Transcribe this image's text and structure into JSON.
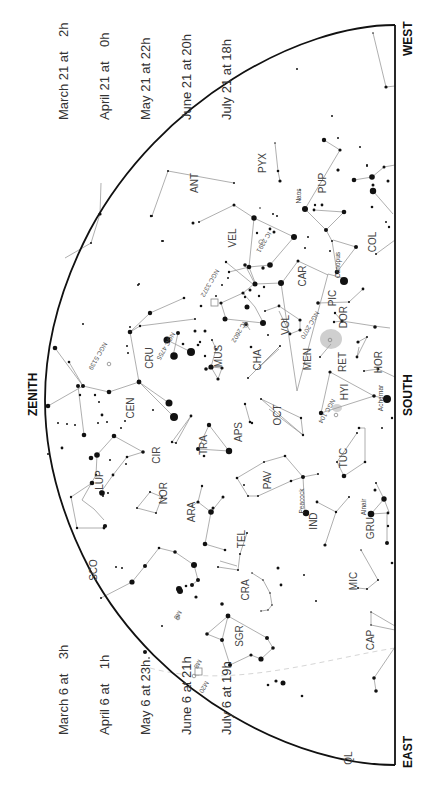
{
  "chart_title": "",
  "directions": {
    "west": "WEST",
    "east": "EAST",
    "south": "SOUTH",
    "zenith": "ZENITH"
  },
  "date_blocks": {
    "top": [
      "March 21 at    2h",
      "April 21 at    0h",
      "May 21 at 22h",
      "June 21 at 20h",
      "July 21 at 18h"
    ],
    "bottom": [
      "March 6 at    3h",
      "April 6 at    1h",
      "May 6 at 23h",
      "June 6 at 21h",
      "July 6 at 19h"
    ]
  },
  "colors": {
    "ink": "#111111",
    "line": "#9a9a9a",
    "label": "#444444",
    "nebula": "#c8c8c8",
    "ecliptic": "#d8d8d8"
  },
  "constellations": [
    {
      "abbr": "ANT",
      "x": 198,
      "y": 183
    },
    {
      "abbr": "PYX",
      "x": 266,
      "y": 163
    },
    {
      "abbr": "PUP",
      "x": 326,
      "y": 183
    },
    {
      "abbr": "VEL",
      "x": 236,
      "y": 238
    },
    {
      "abbr": "COL",
      "x": 376,
      "y": 242
    },
    {
      "abbr": "CAR",
      "x": 306,
      "y": 276
    },
    {
      "abbr": "PIC",
      "x": 336,
      "y": 298
    },
    {
      "abbr": "DOR",
      "x": 347,
      "y": 317
    },
    {
      "abbr": "VOL",
      "x": 289,
      "y": 325
    },
    {
      "abbr": "MUS",
      "x": 222,
      "y": 356
    },
    {
      "abbr": "CRU",
      "x": 153,
      "y": 358
    },
    {
      "abbr": "CHA",
      "x": 261,
      "y": 360
    },
    {
      "abbr": "MEN",
      "x": 311,
      "y": 359
    },
    {
      "abbr": "RET",
      "x": 346,
      "y": 362
    },
    {
      "abbr": "HOR",
      "x": 382,
      "y": 362
    },
    {
      "abbr": "CEN",
      "x": 134,
      "y": 408
    },
    {
      "abbr": "HYI",
      "x": 348,
      "y": 392
    },
    {
      "abbr": "OCT",
      "x": 281,
      "y": 415
    },
    {
      "abbr": "APS",
      "x": 242,
      "y": 432
    },
    {
      "abbr": "TRA",
      "x": 207,
      "y": 445
    },
    {
      "abbr": "CIR",
      "x": 160,
      "y": 455
    },
    {
      "abbr": "TUC",
      "x": 347,
      "y": 458
    },
    {
      "abbr": "PAV",
      "x": 271,
      "y": 480
    },
    {
      "abbr": "LUP",
      "x": 103,
      "y": 480
    },
    {
      "abbr": "NOR",
      "x": 167,
      "y": 493
    },
    {
      "abbr": "ARA",
      "x": 195,
      "y": 512
    },
    {
      "abbr": "IND",
      "x": 317,
      "y": 521
    },
    {
      "abbr": "GRU",
      "x": 374,
      "y": 528
    },
    {
      "abbr": "TEL",
      "x": 245,
      "y": 539
    },
    {
      "abbr": "SCO",
      "x": 97,
      "y": 570
    },
    {
      "abbr": "MIC",
      "x": 357,
      "y": 581
    },
    {
      "abbr": "CRA",
      "x": 249,
      "y": 590
    },
    {
      "abbr": "SGR",
      "x": 243,
      "y": 636
    },
    {
      "abbr": "CAP",
      "x": 374,
      "y": 640
    },
    {
      "abbr": "QL",
      "x": 352,
      "y": 758
    }
  ],
  "named_stars": [
    {
      "name": "Naos",
      "x": 301,
      "y": 196
    },
    {
      "name": "Canopus",
      "x": 340,
      "y": 265
    },
    {
      "name": "Achernar",
      "x": 383,
      "y": 398
    },
    {
      "name": "Peacock",
      "x": 304,
      "y": 501
    },
    {
      "name": "Alnair",
      "x": 366,
      "y": 507
    }
  ],
  "deep_sky": [
    {
      "name": "IC 2391",
      "x": 262,
      "y": 241
    },
    {
      "name": "NGC 3372",
      "x": 208,
      "y": 282
    },
    {
      "name": "IC 2602",
      "x": 237,
      "y": 331
    },
    {
      "name": "NGC 2070",
      "x": 308,
      "y": 324
    },
    {
      "name": "NGC 4755",
      "x": 164,
      "y": 345
    },
    {
      "name": "NGC 5139",
      "x": 96,
      "y": 355
    },
    {
      "name": "NGC 104",
      "x": 325,
      "y": 410
    },
    {
      "name": "M6",
      "x": 176,
      "y": 614
    },
    {
      "name": "M8",
      "x": 196,
      "y": 663
    },
    {
      "name": "M20",
      "x": 202,
      "y": 686
    }
  ]
}
